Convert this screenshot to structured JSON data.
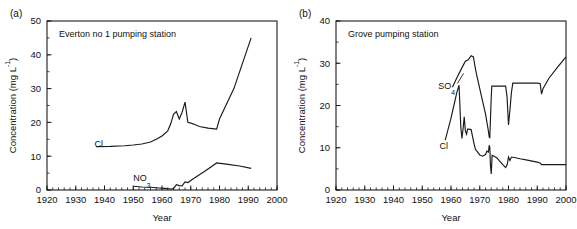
{
  "figure": {
    "panels": [
      {
        "panel_label": "(a)",
        "title": "Everton no 1 pumping station",
        "chart_data": {
          "type": "line",
          "title": "Everton no 1 pumping station",
          "xlabel": "Year",
          "ylabel": "Concentration (mg L",
          "ylabel_sup": "-1",
          "ylabel_tail": ")",
          "xlim": [
            1920,
            2000
          ],
          "ylim": [
            0,
            50
          ],
          "xticks": [
            1920,
            1930,
            1940,
            1950,
            1960,
            1970,
            1980,
            1990,
            2000
          ],
          "yticks": [
            0,
            10,
            20,
            30,
            40,
            50
          ],
          "xtick_labels": [
            "1920",
            "1930",
            "1940",
            "1950",
            "1960",
            "1970",
            "1980",
            "1990",
            "2000"
          ],
          "ytick_labels": [
            "0",
            "10",
            "20",
            "30",
            "40",
            "50"
          ],
          "minor_x_interval": 2,
          "minor_y_interval": 5,
          "grid": false,
          "legend_position": "inline-annotation",
          "series": [
            {
              "name": "Cl",
              "label": "Cl",
              "label_x": 1938,
              "label_y": 12.6,
              "x": [
                1937,
                1942,
                1947,
                1950,
                1953,
                1956,
                1958,
                1960,
                1962,
                1963,
                1964,
                1965,
                1966,
                1967,
                1968,
                1969,
                1970,
                1971,
                1973,
                1976,
                1979,
                1980,
                1985,
                1991
              ],
              "y": [
                12.8,
                12.9,
                13.1,
                13.3,
                13.6,
                14.2,
                15.0,
                16.0,
                17.5,
                19.5,
                22.4,
                23.2,
                21.0,
                23.0,
                26.0,
                20.0,
                19.8,
                19.5,
                18.8,
                18.3,
                18.0,
                21.0,
                30.0,
                45.0
              ]
            },
            {
              "name": "NO3",
              "label": "NO",
              "label_sub": "3",
              "label_x": 1953,
              "label_y": 2.6,
              "x": [
                1950,
                1953,
                1956,
                1959,
                1961,
                1963,
                1964,
                1965,
                1966,
                1967,
                1968,
                1969,
                1971,
                1973,
                1975,
                1977,
                1979,
                1983,
                1987,
                1991
              ],
              "y": [
                1.1,
                0.9,
                0.8,
                0.6,
                0.5,
                0.3,
                0.4,
                1.6,
                1.3,
                1.2,
                2.4,
                2.2,
                3.4,
                4.5,
                5.6,
                6.8,
                8.0,
                7.6,
                7.1,
                6.4
              ]
            }
          ]
        }
      },
      {
        "panel_label": "(b)",
        "title": "Grove pumping station",
        "chart_data": {
          "type": "line",
          "title": "Grove pumping station",
          "xlabel": "Year",
          "ylabel": "Concentration (mg L",
          "ylabel_sup": "-1",
          "ylabel_tail": ")",
          "xlim": [
            1920,
            2000
          ],
          "ylim": [
            0,
            40
          ],
          "xticks": [
            1920,
            1930,
            1940,
            1950,
            1960,
            1970,
            1980,
            1990,
            2000
          ],
          "yticks": [
            0,
            10,
            20,
            30,
            40
          ],
          "xtick_labels": [
            "1920",
            "1930",
            "1940",
            "1950",
            "1960",
            "1970",
            "1980",
            "1990",
            "2000"
          ],
          "ytick_labels": [
            "0",
            "10",
            "20",
            "30",
            "40"
          ],
          "minor_x_interval": 2,
          "minor_y_interval": 5,
          "grid": false,
          "legend_position": "inline-annotation",
          "series": [
            {
              "name": "SO4",
              "label": "SO",
              "label_sub": "4",
              "label_x": 1958.5,
              "label_y": 24.0,
              "leader": [
                [
                  1962.2,
                  25.2
                ],
                [
                  1964.4,
                  27.6
                ]
              ],
              "x": [
                1960.5,
                1962,
                1964,
                1965,
                1966,
                1967,
                1967.8,
                1968.4,
                1969,
                1970,
                1971,
                1972,
                1973,
                1973.3,
                1973.5,
                1974,
                1974.2,
                1976,
                1978,
                1979,
                1979.5,
                1980,
                1980.5,
                1981,
                1981.5,
                1982,
                1983,
                1986,
                1990,
                1991,
                1991.5,
                1992,
                1994,
                1997,
                2000
              ],
              "y": [
                24.3,
                26.5,
                29.2,
                30.5,
                30.8,
                31.8,
                31.5,
                29.0,
                27.0,
                24.0,
                21.0,
                18.0,
                14.0,
                12.5,
                12.4,
                22.0,
                24.6,
                24.6,
                24.6,
                24.6,
                22.0,
                15.4,
                19.0,
                23.0,
                25.3,
                25.3,
                25.3,
                25.3,
                25.3,
                25.2,
                22.7,
                24.0,
                26.4,
                29.0,
                31.5
              ]
            },
            {
              "name": "Cl",
              "label": "Cl",
              "label_x": 1957.5,
              "label_y": 9.6,
              "x": [
                1958,
                1960,
                1961,
                1962,
                1962.8,
                1963.1,
                1963.4,
                1963.8,
                1964.2,
                1964.6,
                1965,
                1965.4,
                1965.8,
                1966.2,
                1967,
                1968,
                1968.5,
                1969,
                1970,
                1971,
                1972,
                1972.5,
                1973,
                1973.3,
                1973.5,
                1973.7,
                1974,
                1974.3,
                1975,
                1976,
                1977,
                1978,
                1979,
                1979.5,
                1980,
                1980.5,
                1981,
                1982,
                1984,
                1987,
                1990,
                1991,
                1991.5,
                1993,
                1996,
                2000
              ],
              "y": [
                11.8,
                17.0,
                20.0,
                23.0,
                24.8,
                20.0,
                15.0,
                12.2,
                14.5,
                17.3,
                14.0,
                13.2,
                14.4,
                14.4,
                14.3,
                11.0,
                9.6,
                9.2,
                8.3,
                8.0,
                8.4,
                9.2,
                9.0,
                10.6,
                10.1,
                6.0,
                3.8,
                8.2,
                8.0,
                7.6,
                6.8,
                6.0,
                5.3,
                5.9,
                7.8,
                7.0,
                7.8,
                7.7,
                7.4,
                7.0,
                6.6,
                6.4,
                6.0,
                6.0,
                6.0,
                6.0
              ]
            }
          ]
        }
      }
    ]
  }
}
